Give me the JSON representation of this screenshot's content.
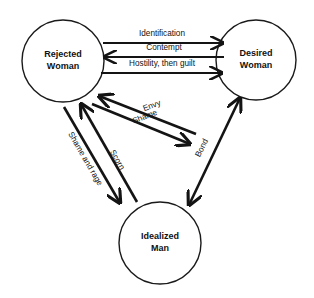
{
  "diagram": {
    "type": "node-link-diagram",
    "background_color": "#ffffff",
    "stroke_color": "#141414",
    "nodes": [
      {
        "id": "rejected-woman",
        "label_line1": "Rejected",
        "label_line2": "Woman",
        "cx": 63,
        "cy": 61,
        "r": 41
      },
      {
        "id": "desired-woman",
        "label_line1": "Desired",
        "label_line2": "Woman",
        "cx": 256,
        "cy": 60,
        "r": 40
      },
      {
        "id": "idealized-man",
        "label_line1": "Idealized",
        "label_line2": "Man",
        "cx": 160,
        "cy": 243,
        "r": 41
      }
    ],
    "edges": [
      {
        "id": "identification",
        "label": "Identification",
        "from": "rejected-woman",
        "to": "desired-woman",
        "direction": "right",
        "style": "horizontal"
      },
      {
        "id": "contempt",
        "label": "Contempt",
        "from": "desired-woman",
        "to": "rejected-woman",
        "direction": "left",
        "style": "horizontal"
      },
      {
        "id": "hostility-then-guilt",
        "label": "Hostility, then guilt",
        "from": "rejected-woman",
        "to": "desired-woman",
        "direction": "right",
        "style": "horizontal"
      },
      {
        "id": "envy",
        "label": "Envy",
        "from": "idealized-man",
        "to": "rejected-woman",
        "direction": "up-left",
        "style": "diagonal"
      },
      {
        "id": "shame",
        "label": "Shame",
        "from": "rejected-woman",
        "to": "idealized-man",
        "direction": "down-right",
        "style": "diagonal"
      },
      {
        "id": "scorn",
        "label": "Scorn",
        "from": "idealized-man",
        "to": "rejected-woman",
        "direction": "up-left",
        "style": "diagonal"
      },
      {
        "id": "shame-and-rage",
        "label": "Shame and rage",
        "from": "rejected-woman",
        "to": "idealized-man",
        "direction": "down-right",
        "style": "diagonal"
      },
      {
        "id": "bond",
        "label": "Bond",
        "from": "desired-woman",
        "to": "idealized-man",
        "direction": "both",
        "style": "diagonal"
      }
    ]
  }
}
